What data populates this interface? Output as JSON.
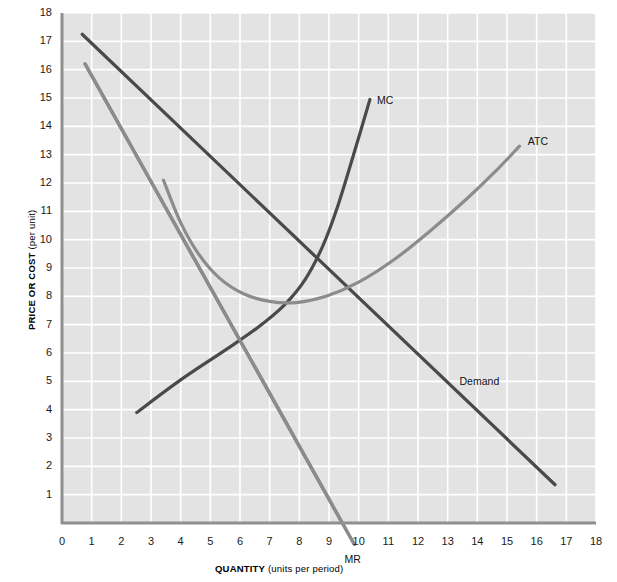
{
  "chart_data": {
    "type": "line",
    "title": "",
    "xlabel": "QUANTITY (units per period)",
    "xlabel_bold": "QUANTITY",
    "xlabel_rest": " (units per period)",
    "ylabel": "PRICE OR COST (per unit)",
    "ylabel_bold": "PRICE OR COST",
    "ylabel_rest": " (per unit)",
    "xlim": [
      0,
      18
    ],
    "ylim": [
      0,
      18
    ],
    "xticks": [
      "0",
      "1",
      "2",
      "3",
      "4",
      "5",
      "6",
      "7",
      "8",
      "9",
      "10",
      "11",
      "12",
      "13",
      "14",
      "15",
      "16",
      "17",
      "18"
    ],
    "yticks": [
      "1",
      "2",
      "3",
      "4",
      "5",
      "6",
      "7",
      "8",
      "9",
      "10",
      "11",
      "12",
      "13",
      "14",
      "15",
      "16",
      "17",
      "18"
    ],
    "grid": true,
    "legend": "inline-labels",
    "plot_background": "#e3e3e3",
    "gridline_color": "#ffffff",
    "series": [
      {
        "name": "Demand",
        "label": "Demand",
        "color": "#4a4a4a",
        "width": 3.2,
        "kind": "straight",
        "points": [
          [
            0.68,
            17.25
          ],
          [
            16.62,
            1.35
          ]
        ]
      },
      {
        "name": "MR",
        "label": "MR",
        "color": "#8c8c8c",
        "width": 3.2,
        "kind": "straight",
        "points": [
          [
            0.78,
            16.2
          ],
          [
            9.85,
            -0.75
          ]
        ]
      },
      {
        "name": "MC",
        "label": "MC",
        "color": "#4a4a4a",
        "width": 3.2,
        "kind": "curve",
        "points": [
          [
            2.52,
            3.9
          ],
          [
            4.0,
            5.05
          ],
          [
            5.5,
            6.1
          ],
          [
            6.6,
            6.9
          ],
          [
            7.5,
            7.7
          ],
          [
            8.2,
            8.6
          ],
          [
            8.8,
            9.8
          ],
          [
            9.3,
            11.2
          ],
          [
            9.8,
            12.9
          ],
          [
            10.38,
            14.95
          ]
        ]
      },
      {
        "name": "ATC",
        "label": "ATC",
        "color": "#8c8c8c",
        "width": 3.2,
        "kind": "curve",
        "points": [
          [
            3.42,
            12.1
          ],
          [
            4.0,
            10.6
          ],
          [
            4.6,
            9.5
          ],
          [
            5.3,
            8.65
          ],
          [
            6.1,
            8.1
          ],
          [
            7.0,
            7.82
          ],
          [
            7.9,
            7.78
          ],
          [
            8.9,
            8.0
          ],
          [
            10.0,
            8.5
          ],
          [
            11.2,
            9.3
          ],
          [
            12.4,
            10.3
          ],
          [
            13.6,
            11.4
          ],
          [
            14.6,
            12.4
          ],
          [
            15.42,
            13.3
          ]
        ]
      }
    ],
    "annotations": [
      {
        "text": "MC",
        "x": 10.62,
        "y": 14.9,
        "name": "mc-curve-label"
      },
      {
        "text": "ATC",
        "x": 15.7,
        "y": 13.45,
        "name": "atc-curve-label"
      },
      {
        "text": "Demand",
        "x": 13.4,
        "y": 4.98,
        "name": "demand-curve-label"
      },
      {
        "text": "MR",
        "x": 9.52,
        "y": -1.3,
        "name": "mr-curve-label"
      }
    ]
  }
}
